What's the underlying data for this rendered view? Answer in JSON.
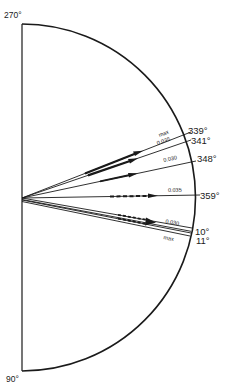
{
  "diagram": {
    "axis_labels": {
      "top": "270°",
      "bottom": "90°"
    },
    "rays": [
      {
        "id": "r339",
        "angle_label": "339°",
        "screen_angle_deg": -21,
        "annotation": "max",
        "style": "solid-arrow"
      },
      {
        "id": "r341",
        "angle_label": "341°",
        "screen_angle_deg": -19,
        "annotation": "0.035",
        "style": "solid-arrow"
      },
      {
        "id": "r348",
        "angle_label": "348°",
        "screen_angle_deg": -12,
        "annotation": "0.030",
        "style": "solid-arrow"
      },
      {
        "id": "r359",
        "angle_label": "359°",
        "screen_angle_deg": -1,
        "annotation": "0.035",
        "style": "dashed-arrow"
      },
      {
        "id": "r10",
        "angle_label": "10°",
        "screen_angle_deg": 10,
        "annotation": "0.030",
        "style": "dashed-double-arrow"
      },
      {
        "id": "r11",
        "angle_label": "11°",
        "screen_angle_deg": 11,
        "annotation": "max",
        "style": "dashed-double-arrow"
      }
    ],
    "colors": {
      "ink": "#1a1a1a",
      "background": "#ffffff"
    }
  }
}
